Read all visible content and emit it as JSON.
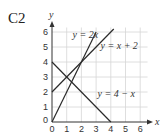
{
  "question_label": "C2",
  "chart_data": {
    "type": "line",
    "title": "",
    "xlabel": "x",
    "ylabel": "y",
    "xlim": [
      0,
      6.5
    ],
    "ylim": [
      0,
      6.3
    ],
    "grid": true,
    "x_ticks": [
      "0",
      "1",
      "2",
      "3",
      "4",
      "5",
      "6"
    ],
    "y_ticks": [
      "0",
      "1",
      "2",
      "3",
      "4",
      "5",
      "6"
    ],
    "series": [
      {
        "name": "y = 2x",
        "x": [
          0,
          3
        ],
        "y": [
          0,
          6
        ],
        "label_pos": [
          1.4,
          5.6
        ]
      },
      {
        "name": "y = x + 2",
        "x": [
          0,
          4.2
        ],
        "y": [
          2,
          6.2
        ],
        "label_pos": [
          3.3,
          4.9
        ]
      },
      {
        "name": "y = 4 − x",
        "x": [
          0,
          4
        ],
        "y": [
          4,
          0
        ],
        "label_pos": [
          3.1,
          1.7
        ]
      }
    ],
    "colors": {
      "lines": "#2a2a2a",
      "grid": "#d6d6d6",
      "axes": "#333333"
    }
  }
}
